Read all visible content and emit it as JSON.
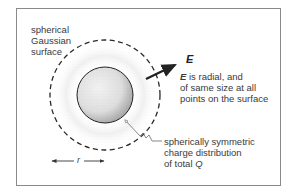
{
  "diagram": {
    "gaussian_surface_label": [
      "spherical",
      "Gaussian",
      "surface"
    ],
    "field_symbol": "E",
    "field_description": {
      "symbol": "E",
      "line1_rest": " is radial, and",
      "line2": "of same size at all",
      "line3": "points on the surface"
    },
    "charge_label": {
      "line1": "spherically symmetric",
      "line2": "charge distribution",
      "line3_prefix": "of total ",
      "line3_symbol": "Q"
    },
    "radius_symbol": "r",
    "colors": {
      "border": "#8a8a8a",
      "stroke": "#222222",
      "text": "#3a3a3a",
      "shading": "#9a9a9a"
    }
  }
}
